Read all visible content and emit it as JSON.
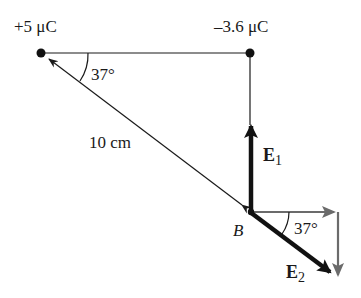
{
  "diagram": {
    "type": "electric-field-vector-diagram",
    "charges": [
      {
        "id": "q1",
        "label": "+5 μC",
        "x": 41,
        "y": 53
      },
      {
        "id": "q2",
        "label": "–3.6 μC",
        "x": 250,
        "y": 53
      }
    ],
    "point": {
      "label": "B",
      "x": 250,
      "y": 212
    },
    "distance_label": "10 cm",
    "angle_top_label": "37°",
    "angle_bottom_label": "37°",
    "vectors": {
      "E1": {
        "label_main": "E",
        "label_sub": "1"
      },
      "E2": {
        "label_main": "E",
        "label_sub": "2"
      }
    },
    "colors": {
      "line": "#1a1a1a",
      "vector": "#111111",
      "component": "#6b6b6b"
    }
  }
}
